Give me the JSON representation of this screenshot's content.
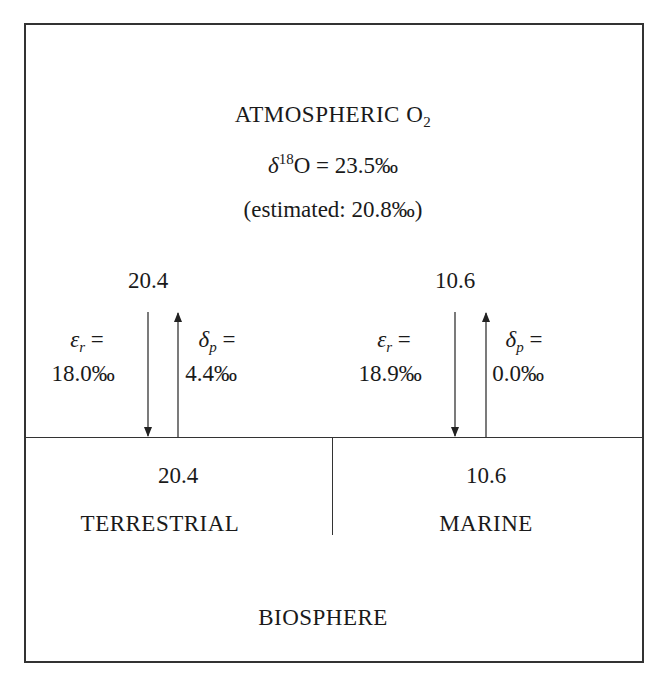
{
  "atmosphere": {
    "title": "ATMOSPHERIC O",
    "title_sub": "2",
    "delta_symbol": "δ",
    "delta_sup": "18",
    "delta_rest": "O = 23.5‰",
    "estimated": "(estimated: 20.8‰)"
  },
  "fluxes": {
    "terrestrial": {
      "flux_value": "20.4",
      "eps_symbol": "ε",
      "eps_sub": "r",
      "eps_eq": " =",
      "eps_value": "18.0‰",
      "delta_symbol": "δ",
      "delta_sub": "p",
      "delta_eq": " =",
      "delta_value": "4.4‰"
    },
    "marine": {
      "flux_value": "10.6",
      "eps_symbol": "ε",
      "eps_sub": "r",
      "eps_eq": " =",
      "eps_value": "18.9‰",
      "delta_symbol": "δ",
      "delta_sub": "p",
      "delta_eq": " =",
      "delta_value": "0.0‰"
    }
  },
  "biosphere": {
    "terrestrial": {
      "value": "20.4",
      "label": "TERRESTRIAL"
    },
    "marine": {
      "value": "10.6",
      "label": "MARINE"
    },
    "label": "BIOSPHERE"
  }
}
